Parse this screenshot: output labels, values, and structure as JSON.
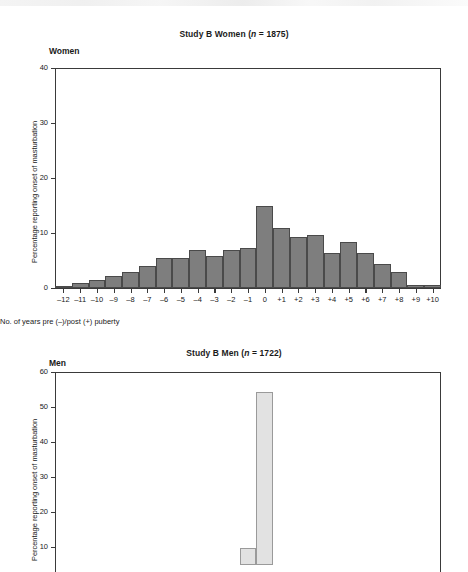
{
  "document": {
    "kind": "scanned-journal-figure",
    "panels": 2
  },
  "panel_women": {
    "title_main": "Study B  Women (",
    "title_italic": "n",
    "title_tail": " = 1875)",
    "title_full": "Study B  Women (n = 1875)",
    "tag": "Women",
    "ylabel": "Percentage reporting onset of masturbation",
    "xlabel": "No. of years pre (–)/post (+) puberty",
    "ytick_labels": [
      "40",
      "30",
      "20",
      "10",
      "0"
    ]
  },
  "panel_men": {
    "title_main": "Study B  Men (",
    "title_italic": "n",
    "title_tail": " = 1722)",
    "title_full": "Study B  Men (n = 1722)",
    "tag": "Men",
    "ylabel": "Percentage reporting onset of masturbation",
    "ytick_labels": [
      "60",
      "50",
      "40",
      "30",
      "20",
      "10"
    ]
  },
  "chart_data": [
    {
      "type": "bar",
      "id": "women",
      "title": "Study B  Women (n = 1875)",
      "subtitle": "Women",
      "xlabel": "No. of years pre (–)/post (+) puberty",
      "ylabel": "Percentage reporting onset of masturbation",
      "ylim": [
        0,
        40
      ],
      "yticks": [
        0,
        10,
        20,
        30,
        40
      ],
      "grid": false,
      "legend": "none",
      "categories": [
        "–12",
        "–11",
        "–10",
        "–9",
        "–8",
        "–7",
        "–6",
        "–5",
        "–4",
        "–3",
        "–2",
        "–1",
        "0",
        "+1",
        "+2",
        "+3",
        "+4",
        "+5",
        "+6",
        "+7",
        "+8",
        "+9",
        "+10"
      ],
      "values": [
        0.4,
        1.0,
        1.4,
        2.2,
        2.9,
        4.0,
        5.4,
        5.4,
        7.0,
        5.9,
        6.9,
        7.2,
        14.9,
        11.0,
        9.3,
        9.6,
        6.3,
        8.4,
        6.3,
        4.3,
        2.9,
        0.5,
        0.5
      ],
      "bar_fill": "#7e7e7e",
      "bar_edge": "#4a4a4a"
    },
    {
      "type": "bar",
      "id": "men",
      "title": "Study B  Men (n = 1722)",
      "subtitle": "Men",
      "ylabel": "Percentage reporting onset of masturbation",
      "ylim": [
        0,
        60
      ],
      "yticks": [
        10,
        20,
        30,
        40,
        50,
        60
      ],
      "grid": false,
      "legend": "none",
      "note": "panel is cropped at the bottom edge of the screenshot; only the tall bar near the centre and a short neighbouring bar are visible",
      "categories": [
        "–1",
        "0"
      ],
      "values": [
        9.8,
        54.3
      ],
      "bar_fill": "#e2e2e2",
      "bar_edge": "#9a9a9a"
    }
  ]
}
